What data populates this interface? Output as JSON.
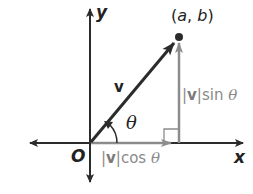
{
  "diagram": {
    "type": "vector-components",
    "colors": {
      "axis": "#2b2b2b",
      "vector": "#2b2b2b",
      "component": "#8c8c8c",
      "background": "#ffffff"
    },
    "labels": {
      "x_axis": "x",
      "y_axis": "y",
      "origin": "O",
      "vector": "v",
      "angle": "θ",
      "point_a": "a",
      "point_sep": ", ",
      "point_b": "b",
      "point_open": "(",
      "point_close": ")",
      "horizontal_component_bar_open": "|",
      "horizontal_component_v": "v",
      "horizontal_component_rest": "|cos ",
      "horizontal_component_theta": "θ",
      "vertical_component_bar_open": "|",
      "vertical_component_v": "v",
      "vertical_component_rest": "|sin ",
      "vertical_component_theta": "θ"
    }
  }
}
